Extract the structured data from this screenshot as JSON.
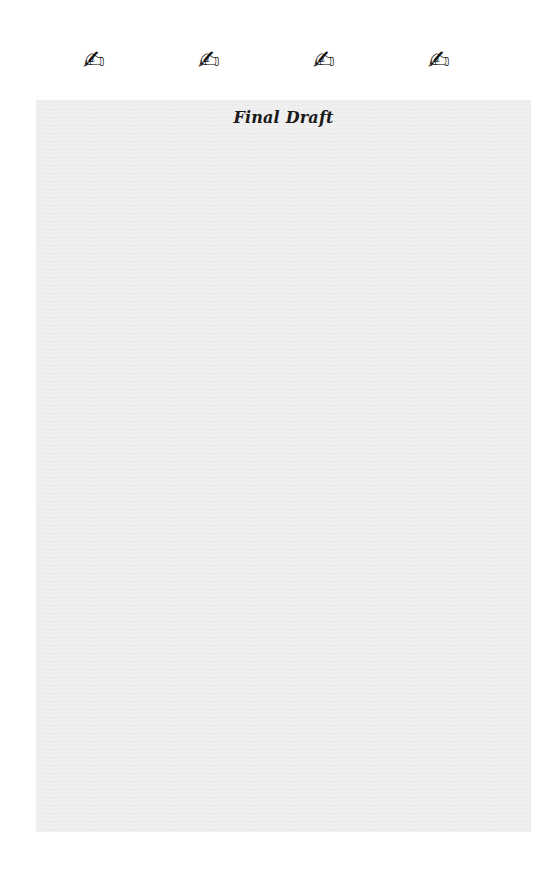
{
  "icons": [
    {
      "name": "writing-hand-icon",
      "glyph": "✍"
    },
    {
      "name": "writing-hand-icon",
      "glyph": "✍"
    },
    {
      "name": "writing-hand-icon",
      "glyph": "✍"
    },
    {
      "name": "writing-hand-icon",
      "glyph": "✍"
    }
  ],
  "panel": {
    "title": "Final Draft",
    "background_color": "#ededed"
  }
}
